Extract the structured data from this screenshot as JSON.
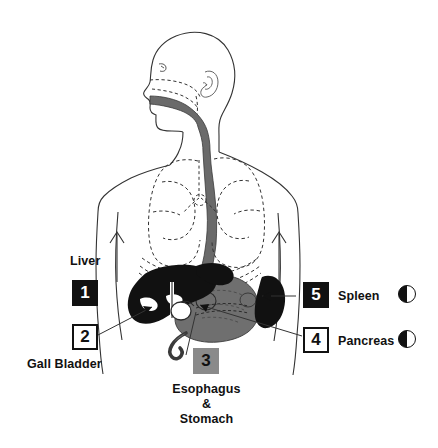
{
  "diagram": {
    "background_color": "#ffffff",
    "ink_color": "#111111",
    "organ_fill_dark": "#111111",
    "organ_fill_mid": "#6f6f6f",
    "organ_fill_gray": "#8a8a8a"
  },
  "legend": {
    "items": [
      {
        "number": "1",
        "label": "Liver",
        "box_style": "dark",
        "label_position": "above",
        "swatch": null
      },
      {
        "number": "2",
        "label": "Gall Bladder",
        "box_style": "light",
        "label_position": "below",
        "swatch": null
      },
      {
        "number": "3",
        "label_lines": [
          "Esophagus",
          "&",
          "Stomach"
        ],
        "label": "Esophagus & Stomach",
        "box_style": "gray",
        "label_position": "below",
        "swatch": null
      },
      {
        "number": "4",
        "label": "Pancreas",
        "box_style": "light",
        "label_position": "right",
        "swatch": "half-filled-circle-icon"
      },
      {
        "number": "5",
        "label": "Spleen",
        "box_style": "dark",
        "label_position": "right",
        "swatch": "half-filled-circle-icon"
      }
    ]
  },
  "anatomy": {
    "structures": [
      "head-profile",
      "ear",
      "nasal-cavity",
      "oral-cavity",
      "pharynx",
      "esophagus",
      "trachea",
      "left-lung",
      "right-lung",
      "diaphragm",
      "liver",
      "gall-bladder",
      "stomach",
      "duodenum",
      "pancreas",
      "spleen",
      "torso-outline"
    ]
  }
}
